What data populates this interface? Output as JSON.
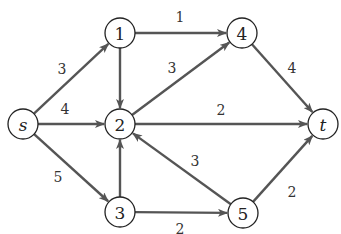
{
  "graph": {
    "nodes": [
      {
        "id": "s",
        "label": "s",
        "italic": true,
        "x": 23,
        "y": 124
      },
      {
        "id": "1",
        "label": "1",
        "italic": false,
        "x": 120,
        "y": 33
      },
      {
        "id": "2",
        "label": "2",
        "italic": false,
        "x": 120,
        "y": 124
      },
      {
        "id": "3",
        "label": "3",
        "italic": false,
        "x": 120,
        "y": 212
      },
      {
        "id": "4",
        "label": "4",
        "italic": false,
        "x": 242,
        "y": 33
      },
      {
        "id": "5",
        "label": "5",
        "italic": false,
        "x": 243,
        "y": 213
      },
      {
        "id": "t",
        "label": "t",
        "italic": true,
        "x": 323,
        "y": 124
      }
    ],
    "edges": [
      {
        "from": "s",
        "to": "1",
        "weight": "3",
        "lx": 62,
        "ly": 69
      },
      {
        "from": "s",
        "to": "2",
        "weight": "4",
        "lx": 65,
        "ly": 109
      },
      {
        "from": "s",
        "to": "3",
        "weight": "5",
        "lx": 58,
        "ly": 177
      },
      {
        "from": "1",
        "to": "4",
        "weight": "1",
        "lx": 180,
        "ly": 17
      },
      {
        "from": "1",
        "to": "2",
        "weight": "",
        "lx": 0,
        "ly": 0
      },
      {
        "from": "2",
        "to": "4",
        "weight": "3",
        "lx": 172,
        "ly": 68
      },
      {
        "from": "2",
        "to": "t",
        "weight": "2",
        "lx": 221,
        "ly": 110
      },
      {
        "from": "3",
        "to": "2",
        "weight": "",
        "lx": 0,
        "ly": 0
      },
      {
        "from": "3",
        "to": "5",
        "weight": "2",
        "lx": 180,
        "ly": 229
      },
      {
        "from": "4",
        "to": "t",
        "weight": "4",
        "lx": 292,
        "ly": 68
      },
      {
        "from": "5",
        "to": "2",
        "weight": "3",
        "lx": 195,
        "ly": 161
      },
      {
        "from": "5",
        "to": "t",
        "weight": "2",
        "lx": 292,
        "ly": 192
      }
    ]
  },
  "colors": {
    "edge": "#555555",
    "node_stroke": "#222222",
    "background": "#ffffff"
  }
}
